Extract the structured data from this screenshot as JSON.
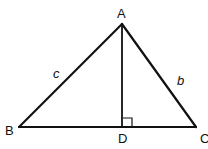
{
  "diagram": {
    "type": "geometry",
    "colors": {
      "stroke": "#111111",
      "background": "#ffffff"
    },
    "vertices": {
      "A": {
        "label": "A",
        "x": 122,
        "y": 24
      },
      "B": {
        "label": "B",
        "x": 19,
        "y": 127
      },
      "C": {
        "label": "C",
        "x": 196,
        "y": 127
      },
      "D": {
        "label": "D",
        "x": 122,
        "y": 127
      }
    },
    "sides": {
      "c": {
        "label": "c",
        "from": "A",
        "to": "B"
      },
      "b": {
        "label": "b",
        "from": "A",
        "to": "C"
      }
    },
    "segments": [
      {
        "name": "AB",
        "from": "A",
        "to": "B"
      },
      {
        "name": "AC",
        "from": "A",
        "to": "C"
      },
      {
        "name": "BC",
        "from": "B",
        "to": "C"
      },
      {
        "name": "AD",
        "from": "A",
        "to": "D"
      }
    ],
    "right_angle_marker": {
      "at": "D",
      "size": 9
    }
  }
}
